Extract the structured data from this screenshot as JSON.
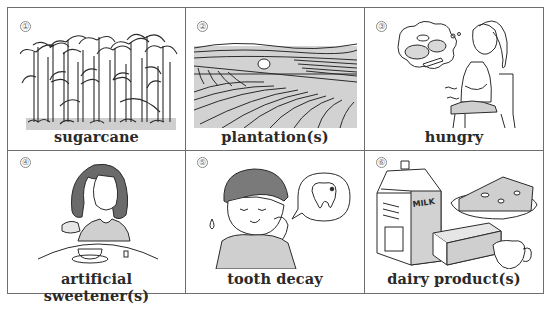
{
  "cards": [
    {
      "number": "①",
      "label": "sugarcane",
      "icon": "sugarcane-illustration"
    },
    {
      "number": "②",
      "label": "plantation(s)",
      "icon": "plantation-illustration"
    },
    {
      "number": "③",
      "label": "hungry",
      "icon": "hungry-woman-illustration"
    },
    {
      "number": "④",
      "label": "artificial sweetener(s)",
      "icon": "sweetener-woman-illustration"
    },
    {
      "number": "⑤",
      "label": "tooth decay",
      "icon": "toothache-boy-illustration"
    },
    {
      "number": "⑥",
      "label": "dairy product(s)",
      "icon": "dairy-products-illustration"
    }
  ],
  "milk_text": "MILK",
  "colors": {
    "border": "#6e6e6e",
    "fill_grey": "#cfcfcf",
    "line": "#2b2b2b"
  }
}
